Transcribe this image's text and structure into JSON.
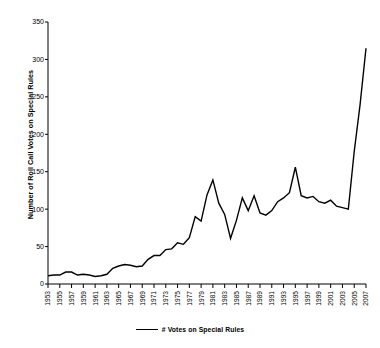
{
  "chart_data": {
    "type": "line",
    "title": "",
    "xlabel": "",
    "ylabel": "Number of Roll Call Votes on Special Rules",
    "ylim": [
      0,
      350
    ],
    "yticks": [
      0,
      50,
      100,
      150,
      200,
      250,
      300,
      350
    ],
    "ytick_labels": [
      "0",
      "50",
      "100",
      "150",
      "200",
      "250",
      "300",
      "350"
    ],
    "grid": false,
    "legend_position": "bottom-center",
    "legend": [
      "# Votes on Special Rules"
    ],
    "xtick_labels": [
      "1953",
      "1955",
      "1957",
      "1959",
      "1961",
      "1963",
      "1965",
      "1967",
      "1969",
      "1971",
      "1973",
      "1975",
      "1977",
      "1979",
      "1981",
      "1983",
      "1985",
      "1987",
      "1989",
      "1991",
      "1993",
      "1995",
      "1997",
      "1999",
      "2001",
      "2003",
      "2005",
      "2007"
    ],
    "x": [
      1953,
      1954,
      1955,
      1956,
      1957,
      1958,
      1959,
      1960,
      1961,
      1962,
      1963,
      1964,
      1965,
      1966,
      1967,
      1968,
      1969,
      1970,
      1971,
      1972,
      1973,
      1974,
      1975,
      1976,
      1977,
      1978,
      1979,
      1980,
      1981,
      1982,
      1983,
      1984,
      1985,
      1986,
      1987,
      1988,
      1989,
      1990,
      1991,
      1992,
      1993,
      1994,
      1995,
      1996,
      1997,
      1998,
      1999,
      2000,
      2001,
      2002,
      2003,
      2004,
      2005,
      2006,
      2007
    ],
    "series": [
      {
        "name": "# Votes on Special Rules",
        "color": "#000000",
        "values": [
          11,
          12,
          12,
          16,
          16,
          12,
          13,
          12,
          10,
          11,
          13,
          21,
          24,
          26,
          25,
          23,
          24,
          33,
          38,
          38,
          46,
          47,
          55,
          53,
          62,
          90,
          84,
          119,
          139,
          108,
          93,
          61,
          85,
          115,
          98,
          118,
          95,
          92,
          98,
          110,
          115,
          122,
          156,
          118,
          115,
          117,
          110,
          108,
          112,
          104,
          102,
          100,
          177,
          240,
          315
        ]
      }
    ]
  },
  "axis": {
    "y_title": "Number of Roll Call Votes on Special Rules"
  },
  "legend": {
    "label": "# Votes on Special Rules"
  }
}
